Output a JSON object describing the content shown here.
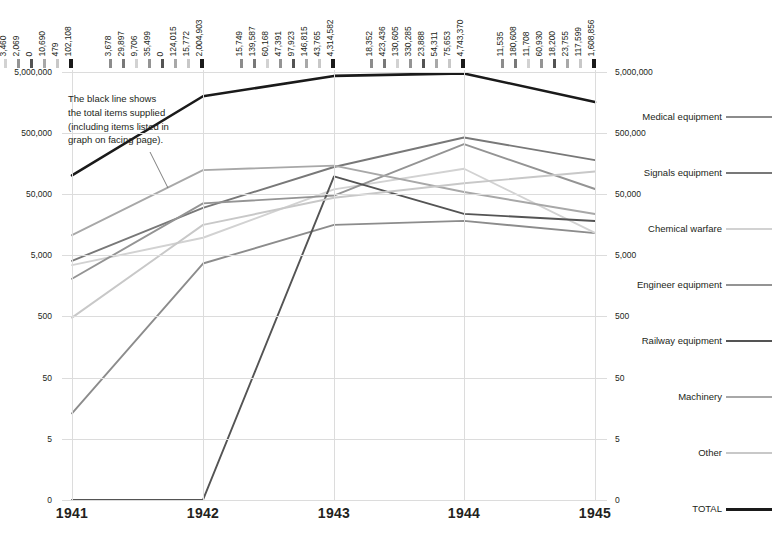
{
  "chart_data": {
    "type": "line",
    "title": "",
    "subtitle": "",
    "xlabel": "",
    "ylabel": "",
    "scale": "log",
    "grid": true,
    "legend_position": "right",
    "categories": [
      "1941",
      "1942",
      "1943",
      "1944",
      "1945"
    ],
    "ytick_labels": [
      "5,000,000",
      "500,000",
      "50,000",
      "5,000",
      "500",
      "50",
      "5",
      "0"
    ],
    "ytick_values": [
      5000000,
      500000,
      50000,
      5000,
      500,
      50,
      5,
      0
    ],
    "ylim": [
      0,
      5000000
    ],
    "axis_both_sides": true,
    "series": [
      {
        "name": "Medical equipment",
        "color": "#8c8c8c",
        "values": [
          13,
          3678,
          15749,
          18352,
          11535
        ],
        "labels": [
          "13",
          "3,678",
          "15,749",
          "18,352",
          "11,535"
        ]
      },
      {
        "name": "Signals equipment",
        "color": "#787878",
        "values": [
          4071,
          29897,
          139587,
          423436,
          180608
        ],
        "labels": [
          "4,071",
          "29,897",
          "139,587",
          "423,436",
          "180,608"
        ]
      },
      {
        "name": "Chemical warfare",
        "color": "#d2d2d2",
        "values": [
          3460,
          9706,
          60168,
          130605,
          11708
        ],
        "labels": [
          "3,460",
          "9,706",
          "60,168",
          "130,605",
          "11,708"
        ]
      },
      {
        "name": "Engineer equipment",
        "color": "#949494",
        "values": [
          2069,
          35499,
          47391,
          330285,
          60930
        ],
        "labels": [
          "2,069",
          "35,499",
          "47,391",
          "330,285",
          "60,930"
        ]
      },
      {
        "name": "Railway equipment",
        "color": "#545454",
        "values": [
          0,
          0,
          97923,
          23888,
          18200
        ],
        "labels": [
          "0",
          "0",
          "97,923",
          "23,888",
          "18,200"
        ]
      },
      {
        "name": "Machinery",
        "color": "#a8a8a8",
        "values": [
          10690,
          124015,
          146815,
          54311,
          23755
        ],
        "labels": [
          "10,690",
          "124,015",
          "146,815",
          "54,311",
          "23,755"
        ]
      },
      {
        "name": "Other",
        "color": "#c8c8c8",
        "values": [
          479,
          15772,
          43765,
          75653,
          117599
        ],
        "labels": [
          "479",
          "15,772",
          "43,765",
          "75,653",
          "117,599"
        ]
      },
      {
        "name": "TOTAL",
        "color": "#1a1a1a",
        "values": [
          102108,
          2004903,
          4314582,
          4743370,
          1608856
        ],
        "labels": [
          "102,108",
          "2,004,903",
          "4,314,582",
          "4,743,370",
          "1,608,856"
        ]
      }
    ],
    "annotation": {
      "lines": [
        "The black line shows",
        "the total items supplied",
        "(including items listed in",
        "graph on facing page)."
      ]
    }
  }
}
